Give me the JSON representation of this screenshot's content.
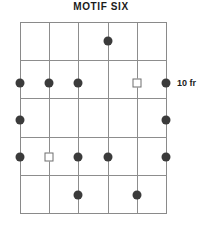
{
  "diagram": {
    "title": "MOTIF SIX",
    "type": "guitar-fretboard-chord-diagram",
    "fret_label": "10 fr",
    "grid": {
      "strings": 6,
      "fret_spaces": 5,
      "left": 20,
      "right": 166,
      "top": 22,
      "bottom": 213,
      "string_x": [
        20,
        49.2,
        78.4,
        107.6,
        136.8,
        166
      ],
      "fret_y": [
        22,
        60.2,
        98.4,
        136.6,
        174.8,
        213
      ],
      "line_color": "#8d8d8d"
    },
    "markers": [
      {
        "shape": "dot",
        "string": 4,
        "fret_space": 1,
        "x": 107.6,
        "y": 41.1
      },
      {
        "shape": "dot",
        "string": 1,
        "fret_space": 2,
        "x": 20,
        "y": 83
      },
      {
        "shape": "dot",
        "string": 2,
        "fret_space": 2,
        "x": 49.2,
        "y": 83
      },
      {
        "shape": "dot",
        "string": 3,
        "fret_space": 2,
        "x": 78.4,
        "y": 83
      },
      {
        "shape": "square",
        "string": 5,
        "fret_space": 2,
        "x": 136.8,
        "y": 83
      },
      {
        "shape": "dot",
        "string": 6,
        "fret_space": 2,
        "x": 166,
        "y": 83
      },
      {
        "shape": "dot",
        "string": 1,
        "fret_space": 3,
        "x": 20,
        "y": 120
      },
      {
        "shape": "dot",
        "string": 6,
        "fret_space": 3,
        "x": 166,
        "y": 120
      },
      {
        "shape": "dot",
        "string": 1,
        "fret_space": 4,
        "x": 20,
        "y": 157
      },
      {
        "shape": "square",
        "string": 2,
        "fret_space": 4,
        "x": 49.2,
        "y": 157
      },
      {
        "shape": "dot",
        "string": 3,
        "fret_space": 4,
        "x": 78.4,
        "y": 157
      },
      {
        "shape": "dot",
        "string": 4,
        "fret_space": 4,
        "x": 107.6,
        "y": 157
      },
      {
        "shape": "dot",
        "string": 6,
        "fret_space": 4,
        "x": 166,
        "y": 157
      },
      {
        "shape": "dot",
        "string": 3,
        "fret_space": 5,
        "x": 78.4,
        "y": 194.5
      },
      {
        "shape": "dot",
        "string": 5,
        "fret_space": 5,
        "x": 136.8,
        "y": 194.5
      }
    ],
    "fret_label_pos": {
      "x": 177,
      "y": 78
    },
    "colors": {
      "dot": "#3b3b3b",
      "square_border": "#6e6e6e",
      "grid": "#8d8d8d",
      "text": "#1b1b1b",
      "background": "#ffffff"
    }
  }
}
